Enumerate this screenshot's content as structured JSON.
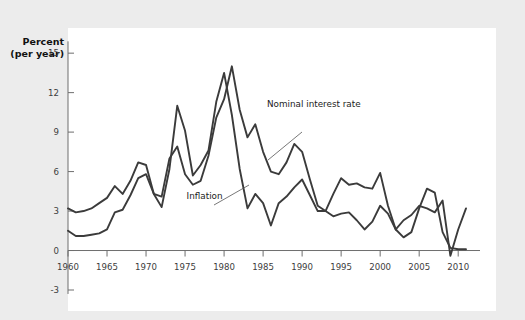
{
  "chart_data": {
    "type": "line",
    "title": "",
    "xlabel": "",
    "ylabel": "Percent (per year)",
    "ylabel_line1": "Percent",
    "ylabel_line2": "(per year)",
    "xlim": [
      1960,
      2011
    ],
    "ylim": [
      -3,
      16
    ],
    "ytick_values": [
      15,
      12,
      9,
      6,
      3,
      0,
      -3
    ],
    "ytick_labels": [
      "15",
      "12",
      "9",
      "6",
      "3",
      "0",
      "-3"
    ],
    "xtick_values": [
      1960,
      1965,
      1970,
      1975,
      1980,
      1985,
      1990,
      1995,
      2000,
      2005,
      2010
    ],
    "xtick_labels": [
      "1960",
      "1965",
      "1970",
      "1975",
      "1980",
      "1985",
      "1990",
      "1995",
      "2000",
      "2005",
      "2010"
    ],
    "grid": false,
    "legend_position": "inline-annotations",
    "line_color": "#3b3b3b",
    "panel_color": "#ffffff",
    "background_color": "#ececec",
    "x": [
      1960,
      1961,
      1962,
      1963,
      1964,
      1965,
      1966,
      1967,
      1968,
      1969,
      1970,
      1971,
      1972,
      1973,
      1974,
      1975,
      1976,
      1977,
      1978,
      1979,
      1980,
      1981,
      1982,
      1983,
      1984,
      1985,
      1986,
      1987,
      1988,
      1989,
      1990,
      1991,
      1992,
      1993,
      1994,
      1995,
      1996,
      1997,
      1998,
      1999,
      2000,
      2001,
      2002,
      2003,
      2004,
      2005,
      2006,
      2007,
      2008,
      2009,
      2010,
      2011
    ],
    "series": [
      {
        "name": "Nominal interest rate",
        "label": "Nominal interest rate",
        "values": [
          3.2,
          2.9,
          3.0,
          3.2,
          3.6,
          4.0,
          4.9,
          4.3,
          5.3,
          6.7,
          6.5,
          4.3,
          4.1,
          7.0,
          7.9,
          5.8,
          5.0,
          5.3,
          7.2,
          10.1,
          11.5,
          14.0,
          10.7,
          8.6,
          9.6,
          7.5,
          6.0,
          5.8,
          6.7,
          8.1,
          7.5,
          5.4,
          3.4,
          3.0,
          4.3,
          5.5,
          5.0,
          5.1,
          4.8,
          4.7,
          5.9,
          3.4,
          1.6,
          1.0,
          1.4,
          3.2,
          4.7,
          4.4,
          1.4,
          0.2,
          0.1,
          0.1
        ],
        "annotation": {
          "text": "Nominal interest rate",
          "x": 1985.5,
          "y": 10.9
        }
      },
      {
        "name": "Inflation",
        "label": "Inflation",
        "values": [
          1.5,
          1.1,
          1.1,
          1.2,
          1.3,
          1.6,
          2.9,
          3.1,
          4.2,
          5.5,
          5.8,
          4.3,
          3.3,
          6.2,
          11.0,
          9.1,
          5.7,
          6.5,
          7.6,
          11.3,
          13.5,
          10.3,
          6.2,
          3.2,
          4.3,
          3.6,
          1.9,
          3.6,
          4.1,
          4.8,
          5.4,
          4.2,
          3.0,
          3.0,
          2.6,
          2.8,
          2.9,
          2.3,
          1.6,
          2.2,
          3.4,
          2.8,
          1.6,
          2.3,
          2.7,
          3.4,
          3.2,
          2.9,
          3.8,
          -0.4,
          1.6,
          3.2
        ],
        "annotation": {
          "text": "Inflation",
          "x": 1975.2,
          "y": 3.9
        }
      }
    ]
  }
}
